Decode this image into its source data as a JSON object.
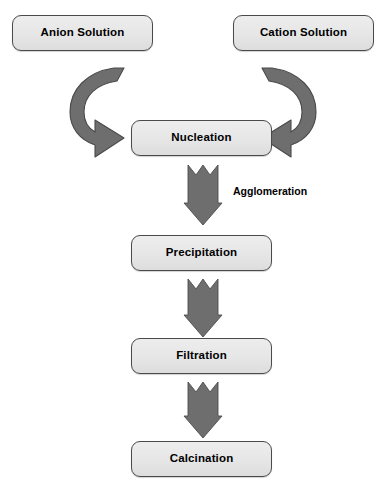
{
  "diagram": {
    "background_color": "#ffffff",
    "node_fill_color": "#e8e8e8",
    "node_border_color": "#4a4a4a",
    "arrow_color": "#707070",
    "arrow_outline_color": "#4d4d4d",
    "text_color": "#000000"
  },
  "nodes": [
    {
      "id": "anion",
      "label": "Anion Solution"
    },
    {
      "id": "cation",
      "label": "Cation Solution"
    },
    {
      "id": "nucleation",
      "label": "Nucleation"
    },
    {
      "id": "precipitation",
      "label": "Precipitation"
    },
    {
      "id": "filtration",
      "label": "Filtration"
    },
    {
      "id": "calcination",
      "label": "Calcination"
    }
  ],
  "edge_labels": [
    {
      "id": "agglomeration",
      "label": "Agglomeration"
    }
  ],
  "arrows": [
    {
      "id": "anion-to-nucleation",
      "shape": "curved-hook-right"
    },
    {
      "id": "cation-to-nucleation",
      "shape": "curved-hook-left"
    },
    {
      "id": "nucleation-to-precipitation",
      "shape": "down-arrow"
    },
    {
      "id": "precipitation-to-filtration",
      "shape": "down-arrow"
    },
    {
      "id": "filtration-to-calcination",
      "shape": "down-arrow"
    }
  ]
}
